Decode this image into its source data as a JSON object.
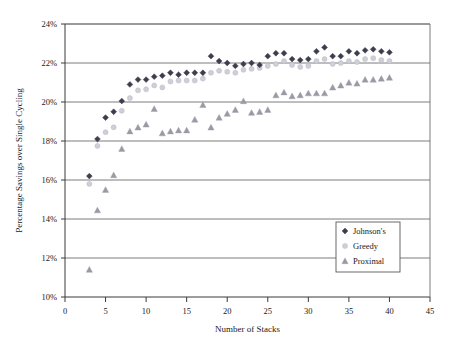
{
  "chart_data": {
    "type": "scatter",
    "title": "",
    "xlabel": "Number of Stacks",
    "ylabel": "Percentage Savings over Single Cycling",
    "xlim": [
      0,
      45
    ],
    "ylim": [
      10,
      24
    ],
    "xticks": [
      0,
      5,
      10,
      15,
      20,
      25,
      30,
      35,
      40,
      45
    ],
    "xtick_labels": [
      "0",
      "5",
      "10",
      "15",
      "20",
      "25",
      "30",
      "35",
      "40",
      "45"
    ],
    "yticks": [
      10,
      12,
      14,
      16,
      18,
      20,
      22,
      24
    ],
    "ytick_labels": [
      "10%",
      "12%",
      "14%",
      "16%",
      "18%",
      "20%",
      "22%",
      "24%"
    ],
    "grid": "horizontal",
    "legend_position": "lower right",
    "x": [
      3,
      4,
      5,
      6,
      7,
      8,
      9,
      10,
      11,
      12,
      13,
      14,
      15,
      16,
      17,
      18,
      19,
      20,
      21,
      22,
      23,
      24,
      25,
      26,
      27,
      28,
      29,
      30,
      31,
      32,
      33,
      34,
      35,
      36,
      37,
      38,
      39,
      40
    ],
    "series": [
      {
        "name": "Johnson's",
        "marker": "diamond",
        "color": "#3d3d4f",
        "values": [
          16.2,
          18.1,
          19.2,
          19.5,
          20.05,
          20.9,
          21.15,
          21.15,
          21.3,
          21.35,
          21.5,
          21.4,
          21.5,
          21.5,
          21.5,
          22.35,
          22.1,
          22.0,
          21.85,
          21.95,
          22.0,
          21.9,
          22.35,
          22.5,
          22.5,
          22.2,
          22.15,
          22.2,
          22.6,
          22.8,
          22.35,
          22.35,
          22.6,
          22.5,
          22.65,
          22.7,
          22.6,
          22.55
        ]
      },
      {
        "name": "Greedy",
        "marker": "circle",
        "color": "#cfcfd8",
        "values": [
          15.8,
          17.75,
          18.45,
          18.7,
          19.55,
          20.2,
          20.6,
          20.65,
          20.85,
          20.75,
          21.05,
          21.1,
          21.1,
          21.1,
          21.2,
          21.5,
          21.6,
          21.55,
          21.5,
          21.65,
          21.7,
          21.75,
          21.85,
          21.95,
          22.1,
          21.9,
          21.8,
          21.85,
          22.1,
          22.2,
          21.95,
          22.0,
          22.1,
          22.05,
          22.2,
          22.25,
          22.15,
          22.1
        ]
      },
      {
        "name": "Proximal",
        "marker": "triangle",
        "color": "#9a9aa6",
        "values": [
          11.4,
          14.45,
          15.5,
          16.25,
          17.6,
          18.5,
          18.7,
          18.85,
          19.65,
          18.4,
          18.5,
          18.55,
          18.55,
          19.1,
          19.85,
          18.7,
          19.2,
          19.4,
          19.6,
          20.05,
          19.45,
          19.5,
          19.6,
          20.35,
          20.5,
          20.3,
          20.35,
          20.45,
          20.45,
          20.45,
          20.75,
          20.85,
          21.0,
          20.95,
          21.15,
          21.15,
          21.2,
          21.25
        ]
      }
    ]
  },
  "legend": {
    "entries": [
      {
        "label": "Johnson's"
      },
      {
        "label": "Greedy"
      },
      {
        "label": "Proximal"
      }
    ]
  }
}
